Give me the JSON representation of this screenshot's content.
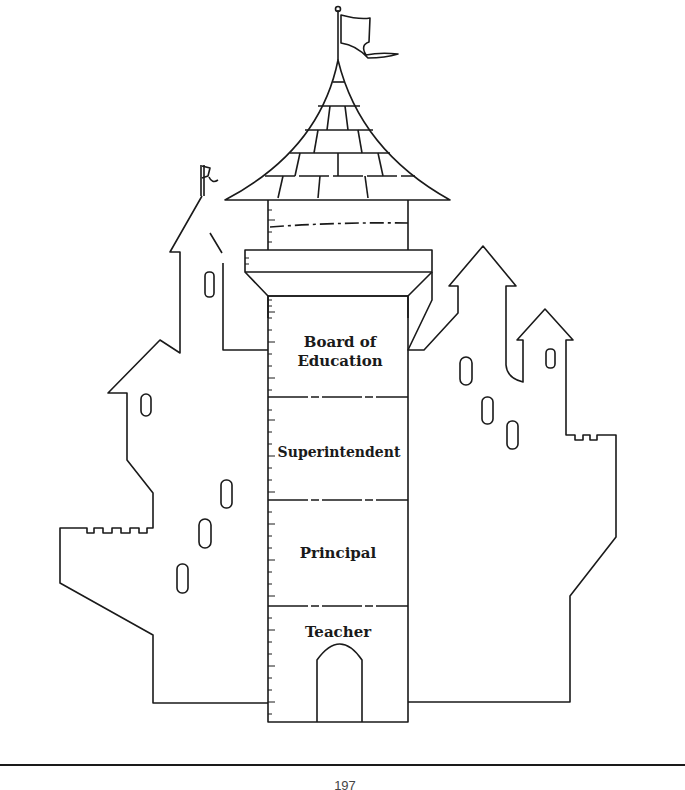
{
  "diagram": {
    "levels": [
      {
        "label": "Board of Education",
        "line1": "Board of",
        "line2": "Education"
      },
      {
        "label": "Superintendent"
      },
      {
        "label": "Principal"
      },
      {
        "label": "Teacher"
      }
    ]
  },
  "footer": {
    "page_number": "197"
  },
  "colors": {
    "line": "#1a1a1a",
    "background": "#ffffff"
  }
}
